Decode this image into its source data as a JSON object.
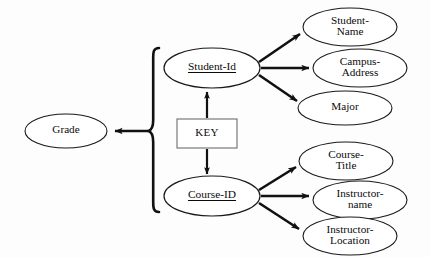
{
  "diagram": {
    "type": "functional-dependency-diagram",
    "colors": {
      "background": "#fdfdfd",
      "stroke": "#111111",
      "text": "#0b0b0b",
      "ellipse_fill": "#ffffff"
    },
    "key_box": {
      "label": "KEY",
      "x": 177,
      "y": 119,
      "width": 60,
      "height": 29
    },
    "determinants": [
      {
        "id": "student-id",
        "label": "Student-Id",
        "underlined": true,
        "cx": 212,
        "cy": 68,
        "rx": 48,
        "ry": 20
      },
      {
        "id": "course-id",
        "label": "Course-ID",
        "underlined": true,
        "cx": 212,
        "cy": 196,
        "rx": 48,
        "ry": 20
      }
    ],
    "dependents": [
      {
        "id": "student-name",
        "label": "Student-\nName",
        "from": "student-id",
        "cx": 350,
        "cy": 27,
        "rx": 47,
        "ry": 19
      },
      {
        "id": "campus-address",
        "label": "Campus-\nAddress",
        "from": "student-id",
        "cx": 360,
        "cy": 68,
        "rx": 47,
        "ry": 19
      },
      {
        "id": "major",
        "label": "Major",
        "from": "student-id",
        "cx": 345,
        "cy": 108,
        "rx": 47,
        "ry": 17
      },
      {
        "id": "course-title",
        "label": "Course-\nTitle",
        "from": "course-id",
        "cx": 346,
        "cy": 161,
        "rx": 47,
        "ry": 19
      },
      {
        "id": "instructor-name",
        "label": "Instructor-\nname",
        "from": "course-id",
        "cx": 360,
        "cy": 200,
        "rx": 47,
        "ry": 19
      },
      {
        "id": "instructor-location",
        "label": "Instructor-\nLocation",
        "from": "course-id",
        "cx": 350,
        "cy": 236,
        "rx": 47,
        "ry": 19
      }
    ],
    "left_node": {
      "id": "grade",
      "label": "Grade",
      "cx": 66,
      "cy": 131,
      "rx": 41,
      "ry": 17
    },
    "brace": {
      "name": "composite-key-brace",
      "top_y": 48,
      "bottom_y": 212,
      "apex_x": 152,
      "apex_y": 131
    },
    "relationships": [
      {
        "from": "composite-key",
        "to": "grade",
        "style": "arrow-left"
      },
      {
        "from": "key-box",
        "to": "student-id",
        "style": "arrow-up"
      },
      {
        "from": "key-box",
        "to": "course-id",
        "style": "arrow-down"
      },
      {
        "from": "student-id",
        "to": "student-name",
        "style": "arrow"
      },
      {
        "from": "student-id",
        "to": "campus-address",
        "style": "arrow"
      },
      {
        "from": "student-id",
        "to": "major",
        "style": "arrow"
      },
      {
        "from": "course-id",
        "to": "course-title",
        "style": "arrow"
      },
      {
        "from": "course-id",
        "to": "instructor-name",
        "style": "arrow"
      },
      {
        "from": "course-id",
        "to": "instructor-location",
        "style": "arrow"
      }
    ]
  }
}
